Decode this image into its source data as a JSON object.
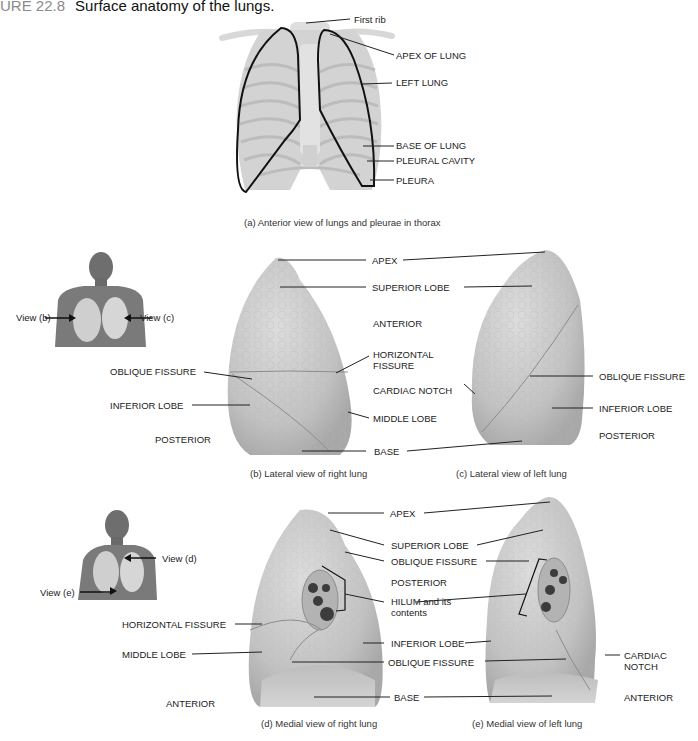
{
  "figure": {
    "number": "URE 22.8",
    "title": "Surface anatomy of the lungs."
  },
  "panel_a": {
    "caption": "(a) Anterior view of lungs and pleurae in thorax",
    "labels": {
      "first_rib": "First rib",
      "apex_of_lung": "APEX OF LUNG",
      "left_lung": "LEFT LUNG",
      "base_of_lung": "BASE OF LUNG",
      "pleural_cavity": "PLEURAL CAVITY",
      "pleura": "PLEURA"
    }
  },
  "orientation_bc": {
    "view_b": "View (b)",
    "view_c": "View (c)"
  },
  "panel_b": {
    "caption": "(b) Lateral view of right lung",
    "labels": {
      "oblique_fissure": "OBLIQUE FISSURE",
      "inferior_lobe": "INFERIOR LOBE",
      "posterior": "POSTERIOR"
    }
  },
  "shared_bc": {
    "apex": "APEX",
    "superior_lobe": "SUPERIOR LOBE",
    "anterior": "ANTERIOR",
    "horizontal_fissure_1": "HORIZONTAL",
    "horizontal_fissure_2": "FISSURE",
    "cardiac_notch": "CARDIAC NOTCH",
    "middle_lobe": "MIDDLE LOBE",
    "base": "BASE"
  },
  "panel_c": {
    "caption": "(c) Lateral view of left lung",
    "labels": {
      "oblique_fissure": "OBLIQUE FISSURE",
      "inferior_lobe": "INFERIOR LOBE",
      "posterior": "POSTERIOR"
    }
  },
  "orientation_de": {
    "view_d": "View (d)",
    "view_e": "View (e)"
  },
  "panel_d": {
    "caption": "(d) Medial view of right lung",
    "labels": {
      "horizontal_fissure": "HORIZONTAL FISSURE",
      "middle_lobe": "MIDDLE LOBE",
      "anterior": "ANTERIOR"
    }
  },
  "shared_de": {
    "apex": "APEX",
    "superior_lobe": "SUPERIOR LOBE",
    "oblique_fissure_top": "OBLIQUE FISSURE",
    "posterior": "POSTERIOR",
    "hilum_1": "HILUM and its",
    "hilum_2": "contents",
    "inferior_lobe": "INFERIOR LOBE",
    "oblique_fissure_bottom": "OBLIQUE FISSURE",
    "base": "BASE"
  },
  "panel_e": {
    "caption": "(e) Medial view of left lung",
    "labels": {
      "cardiac_notch_1": "CARDIAC",
      "cardiac_notch_2": "NOTCH",
      "anterior": "ANTERIOR"
    }
  },
  "colors": {
    "lung_fill": "#c9c9c9",
    "lung_shade": "#a9a9a9",
    "rib": "#d9d9d9",
    "outline": "#111111",
    "skin": "#7a7a7a"
  }
}
